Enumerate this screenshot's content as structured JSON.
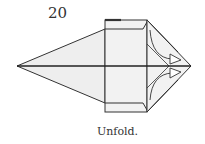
{
  "diagram": {
    "step_number": "20",
    "caption": "Unfold.",
    "colors": {
      "line": "#333333",
      "fill": "#eeeeee",
      "background": "#ffffff"
    }
  }
}
